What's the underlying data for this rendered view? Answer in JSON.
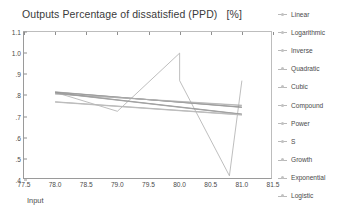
{
  "chart_data": {
    "type": "line",
    "title": "Outputs Percentage of dissatisfied (PPD)   [%]",
    "xlabel": "Input",
    "ylabel": "",
    "xlim": [
      77.5,
      81.5
    ],
    "ylim": [
      0.4,
      1.1
    ],
    "grid": false,
    "legend_position": "right",
    "xticks": [
      "77.5",
      "78.0",
      "78.5",
      "79.0",
      "79.5",
      "80.0",
      "80.5",
      "81.0",
      "81.5"
    ],
    "xtick_values": [
      77.5,
      78.0,
      78.5,
      79.0,
      79.5,
      80.0,
      80.5,
      81.0,
      81.5
    ],
    "yticks": [
      "1.1",
      "1.0",
      ".9",
      ".8",
      ".7",
      ".6",
      ".5",
      ".4"
    ],
    "ytick_values": [
      1.1,
      1.0,
      0.9,
      0.8,
      0.7,
      0.6,
      0.5,
      0.4
    ],
    "x": [
      78.0,
      79.0,
      80.0,
      80.8,
      81.0
    ],
    "series": [
      {
        "name": "Observed",
        "x": [
          78.0,
          79.0,
          80.0,
          80.0,
          80.8,
          81.0
        ],
        "values": [
          0.815,
          0.725,
          1.0,
          0.87,
          0.42,
          0.87
        ],
        "color": "#a8a8a8"
      },
      {
        "name": "Linear",
        "x": [
          78.0,
          81.0
        ],
        "values": [
          0.815,
          0.745
        ],
        "color": "#8c8c8c"
      },
      {
        "name": "Logarithmic",
        "x": [
          78.0,
          81.0
        ],
        "values": [
          0.816,
          0.744
        ],
        "color": "#969696"
      },
      {
        "name": "Inverse",
        "x": [
          78.0,
          81.0
        ],
        "values": [
          0.817,
          0.743
        ],
        "color": "#9e9e9e"
      },
      {
        "name": "Quadratic",
        "x": [
          78.0,
          79.5,
          81.0
        ],
        "values": [
          0.808,
          0.78,
          0.752
        ],
        "color": "#a6a6a6"
      },
      {
        "name": "Cubic",
        "x": [
          78.0,
          79.5,
          81.0
        ],
        "values": [
          0.806,
          0.781,
          0.754
        ],
        "color": "#b0b0b0"
      },
      {
        "name": "Compound",
        "x": [
          78.0,
          81.0
        ],
        "values": [
          0.813,
          0.712
        ],
        "color": "#8f8f8f"
      },
      {
        "name": "Power",
        "x": [
          78.0,
          81.0
        ],
        "values": [
          0.812,
          0.711
        ],
        "color": "#999999"
      },
      {
        "name": "S",
        "x": [
          78.0,
          81.0
        ],
        "values": [
          0.811,
          0.71
        ],
        "color": "#a2a2a2"
      },
      {
        "name": "Growth",
        "x": [
          78.0,
          81.0
        ],
        "values": [
          0.77,
          0.709
        ],
        "color": "#aaaaaa"
      },
      {
        "name": "Exponential",
        "x": [
          78.0,
          81.0
        ],
        "values": [
          0.769,
          0.708
        ],
        "color": "#b4b4b4"
      },
      {
        "name": "Logistic",
        "x": [
          78.0,
          81.0
        ],
        "values": [
          0.768,
          0.707
        ],
        "color": "#bebebe"
      }
    ]
  },
  "legend": {
    "items": [
      {
        "label": "Linear"
      },
      {
        "label": "Logarithmic"
      },
      {
        "label": "Inverse"
      },
      {
        "label": "Quadratic"
      },
      {
        "label": "Cubic"
      },
      {
        "label": "Compound"
      },
      {
        "label": "Power"
      },
      {
        "label": "S"
      },
      {
        "label": "Growth"
      },
      {
        "label": "Exponential"
      },
      {
        "label": "Logistic"
      }
    ]
  }
}
